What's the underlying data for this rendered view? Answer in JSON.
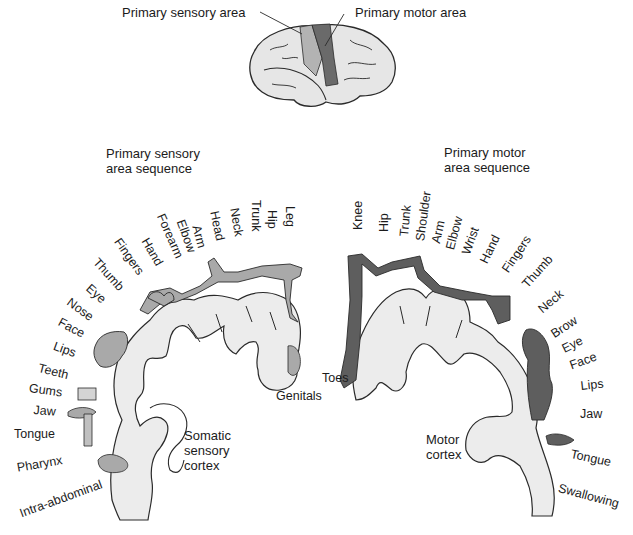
{
  "brain_inset": {
    "sensory_label": "Primary sensory area",
    "motor_label": "Primary motor area"
  },
  "sensory": {
    "title_line1": "Primary sensory",
    "title_line2": "area sequence",
    "cortex_line1": "Somatic",
    "cortex_line2": "sensory",
    "cortex_line3": "cortex",
    "labels": [
      "Leg",
      "Hip",
      "Trunk",
      "Neck",
      "Head",
      "Arm",
      "Elbow",
      "Forearm",
      "Hand",
      "Fingers",
      "Thumb",
      "Eye",
      "Nose",
      "Face",
      "Lips",
      "Teeth",
      "Gums",
      "Jaw",
      "Tongue",
      "Pharynx",
      "Intra-abdominal",
      "Genitals"
    ]
  },
  "motor": {
    "title_line1": "Primary motor",
    "title_line2": "area sequence",
    "cortex_line1": "Motor",
    "cortex_line2": "cortex",
    "labels": [
      "Knee",
      "Hip",
      "Trunk",
      "Shoulder",
      "Arm",
      "Elbow",
      "Wrist",
      "Hand",
      "Fingers",
      "Thumb",
      "Neck",
      "Brow",
      "Eye",
      "Face",
      "Lips",
      "Jaw",
      "Tongue",
      "Swallowing",
      "Toes"
    ]
  },
  "colors": {
    "sensory_fill": "#a9a9a9",
    "motor_fill": "#5e5e5e",
    "cortex_fill": "#ececec",
    "outline": "#2a2a2a"
  }
}
